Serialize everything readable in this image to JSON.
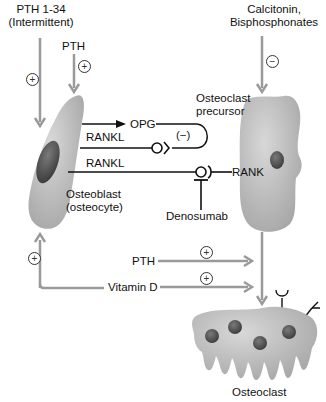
{
  "diagram": {
    "inputs": {
      "pth_1_34": {
        "line1": "PTH 1-34",
        "line2": "(Intermittent)",
        "effect": "+"
      },
      "pth_top": {
        "label": "PTH",
        "effect": "+"
      },
      "calcitonin": {
        "line1": "Calcitonin,",
        "line2": "Bisphosphonates",
        "effect": "−"
      },
      "pth_bottom": {
        "label": "PTH",
        "effect": "+"
      },
      "vitamin_d": {
        "label": "Vitamin D",
        "effect": "+"
      },
      "feedback_effect": "+"
    },
    "cells": {
      "osteoblast": {
        "line1": "Osteoblast",
        "line2": "(osteocyte)"
      },
      "osteoclast_precursor": {
        "line1": "Osteoclast",
        "line2": "precursor"
      },
      "osteoclast": {
        "label": "Osteoclast"
      }
    },
    "molecules": {
      "opg": "OPG",
      "opg_inhibition": "(−)",
      "rankl_1": "RANKL",
      "rankl_2": "RANKL",
      "rank": "RANK",
      "denosumab": "Denosumab"
    },
    "colors": {
      "arrow_gray": "#9a9a9a",
      "line_black": "#111111",
      "cell_fill": "#b9b9b9",
      "nucleus": "#555555",
      "background": "#ffffff"
    }
  }
}
